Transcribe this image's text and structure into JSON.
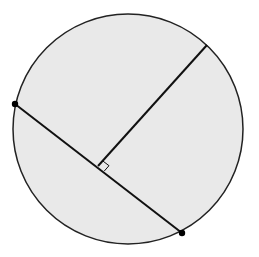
{
  "diagram": {
    "width": 259,
    "height": 257,
    "background": "#ffffff",
    "circle": {
      "cx": 128,
      "cy": 129,
      "r": 115,
      "fill": "#e9e9e9",
      "stroke": "#222222",
      "stroke_width": 1.5
    },
    "chord": {
      "x1": 15,
      "y1": 104,
      "x2": 182,
      "y2": 233,
      "stroke": "#111111",
      "stroke_width": 2
    },
    "perpendicular": {
      "x1": 98,
      "y1": 166,
      "x2": 207,
      "y2": 45,
      "stroke": "#111111",
      "stroke_width": 2
    },
    "right_angle_marker": {
      "points": "98,166 104.3,171 109,165.7 102.6,160.8",
      "stroke": "#111111",
      "stroke_width": 1
    },
    "points": [
      {
        "label": "chord-endpoint-left",
        "x": 15,
        "y": 104,
        "r": 3.2,
        "fill": "#000000"
      },
      {
        "label": "chord-endpoint-right",
        "x": 182,
        "y": 233,
        "r": 3.2,
        "fill": "#000000"
      }
    ]
  }
}
